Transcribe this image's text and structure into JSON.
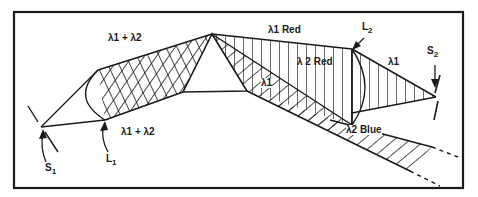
{
  "diagram": {
    "title": "",
    "stroke_color": "#1a1a1a",
    "background": "#ffffff",
    "labels": {
      "combined_top": "λ1 + λ2",
      "combined_bottom": "λ1 + λ2",
      "lambda1_red": "λ1 Red",
      "lambda2_red": "λ 2 Red",
      "lambda1_inner": "λ1",
      "lambda1_right": "λ1",
      "lambda2_blue": "λ2 Blue",
      "source1": "S",
      "source1_sub": "1",
      "source2": "S",
      "source2_sub": "2",
      "lens1": "L",
      "lens1_sub": "1",
      "lens2": "L",
      "lens2_sub": "2"
    },
    "components": [
      {
        "id": "S1",
        "type": "source-slit"
      },
      {
        "id": "L1",
        "type": "collimating-lens"
      },
      {
        "id": "prism",
        "type": "dispersing-prism"
      },
      {
        "id": "L2",
        "type": "focusing-lens"
      },
      {
        "id": "S2",
        "type": "exit-slit"
      }
    ]
  }
}
